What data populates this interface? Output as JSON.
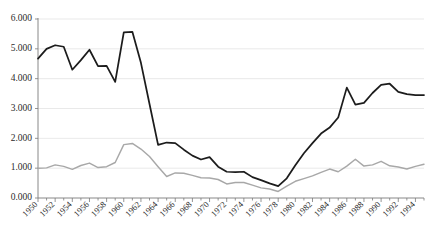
{
  "chart_data": {
    "type": "line",
    "title": "",
    "subtitle": "",
    "xlabel": "",
    "ylabel": "",
    "xlim": [
      1950,
      1995
    ],
    "ylim": [
      0,
      6000
    ],
    "grid": true,
    "legend_position": "none",
    "y_tick_labels": [
      "6.000",
      "5.000",
      "4.000",
      "3.000",
      "2.000",
      "1.000",
      "0.000"
    ],
    "y_tick_values": [
      6000,
      5000,
      4000,
      3000,
      2000,
      1000,
      0
    ],
    "x_tick_labels": [
      "1950",
      "1952",
      "1954",
      "1956",
      "1958",
      "1960",
      "1962",
      "1964",
      "1966",
      "1968",
      "1970",
      "1972",
      "1974",
      "1976",
      "1978",
      "1980",
      "1982",
      "1984",
      "1986",
      "1988",
      "1990",
      "1992",
      "1994"
    ],
    "x_tick_values": [
      1950,
      1952,
      1954,
      1956,
      1958,
      1960,
      1962,
      1964,
      1966,
      1968,
      1970,
      1972,
      1974,
      1976,
      1978,
      1980,
      1982,
      1984,
      1986,
      1988,
      1990,
      1992,
      1994
    ],
    "x": [
      1950,
      1951,
      1952,
      1953,
      1954,
      1955,
      1956,
      1957,
      1958,
      1959,
      1960,
      1961,
      1962,
      1963,
      1964,
      1965,
      1966,
      1967,
      1968,
      1969,
      1970,
      1971,
      1972,
      1973,
      1974,
      1975,
      1976,
      1977,
      1978,
      1979,
      1980,
      1981,
      1982,
      1983,
      1984,
      1985,
      1986,
      1987,
      1988,
      1989,
      1990,
      1991,
      1992,
      1993,
      1994,
      1995
    ],
    "series": [
      {
        "name": "series-primary",
        "color": "#1c1c1c",
        "values": [
          4670,
          5000,
          5120,
          5070,
          4300,
          4620,
          4970,
          4420,
          4430,
          3890,
          5550,
          5570,
          4530,
          3150,
          1780,
          1860,
          1840,
          1620,
          1420,
          1290,
          1370,
          1050,
          880,
          870,
          880,
          700,
          600,
          490,
          400,
          660,
          1100,
          1500,
          1840,
          2160,
          2360,
          2700,
          3700,
          3130,
          3190,
          3520,
          3790,
          3830,
          3560,
          3480,
          3450,
          3450
        ]
      },
      {
        "name": "series-secondary",
        "color": "#a8a8a8",
        "values": [
          1000,
          1010,
          1110,
          1060,
          960,
          1090,
          1170,
          1020,
          1050,
          1190,
          1790,
          1830,
          1640,
          1390,
          1050,
          720,
          840,
          830,
          760,
          680,
          670,
          620,
          470,
          520,
          520,
          430,
          340,
          300,
          220,
          400,
          560,
          650,
          740,
          860,
          970,
          880,
          1070,
          1300,
          1070,
          1110,
          1230,
          1080,
          1040,
          970,
          1060,
          1130
        ]
      }
    ]
  },
  "layout": {
    "plot_left": 38,
    "plot_right": 424,
    "plot_top": 19,
    "plot_bottom": 198
  }
}
